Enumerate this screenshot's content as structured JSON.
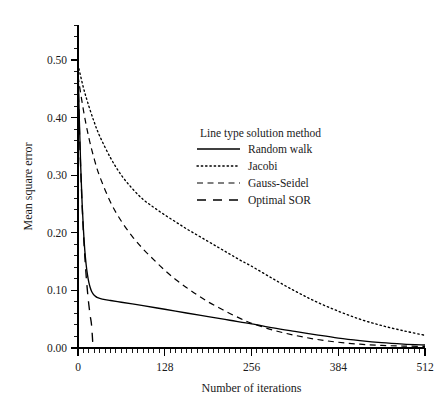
{
  "chart_data": {
    "type": "line",
    "title": "",
    "xlabel": "Number of iterations",
    "ylabel": "Mean square error",
    "xlim": [
      0,
      512
    ],
    "ylim": [
      0.0,
      0.56
    ],
    "xticks": [
      0,
      128,
      256,
      384,
      512
    ],
    "xtick_labels": [
      "0",
      "128",
      "256",
      "384",
      "512"
    ],
    "yticks": [
      0.0,
      0.1,
      0.2,
      0.3,
      0.4,
      0.5
    ],
    "ytick_labels": [
      "0.00",
      "0.10",
      "0.20",
      "0.30",
      "0.40",
      "0.50"
    ],
    "grid": false,
    "legend_position": "upper-center-right",
    "legend_title": "Line type solution method",
    "series": [
      {
        "name": "Random walk",
        "linestyle": "solid",
        "color": "#000000",
        "x": [
          0,
          2,
          4,
          6,
          8,
          10,
          12,
          14,
          16,
          18,
          20,
          22,
          24,
          26,
          28,
          32,
          40,
          48,
          64,
          80,
          96,
          128,
          160,
          192,
          224,
          256,
          288,
          320,
          352,
          384,
          416,
          448,
          480,
          512
        ],
        "y": [
          0.489,
          0.395,
          0.315,
          0.253,
          0.206,
          0.17,
          0.145,
          0.127,
          0.114,
          0.105,
          0.0985,
          0.0945,
          0.0915,
          0.0895,
          0.088,
          0.0862,
          0.084,
          0.0825,
          0.0795,
          0.0765,
          0.0735,
          0.0672,
          0.0608,
          0.0545,
          0.0482,
          0.042,
          0.035,
          0.0288,
          0.0228,
          0.0172,
          0.0128,
          0.0092,
          0.0068,
          0.0052
        ]
      },
      {
        "name": "Jacobi",
        "linestyle": "dotted",
        "color": "#000000",
        "x": [
          0,
          8,
          16,
          24,
          32,
          48,
          64,
          80,
          96,
          112,
          128,
          144,
          160,
          176,
          192,
          208,
          224,
          240,
          256,
          288,
          320,
          352,
          384,
          416,
          448,
          480,
          512
        ],
        "y": [
          0.492,
          0.452,
          0.42,
          0.392,
          0.368,
          0.33,
          0.3,
          0.277,
          0.258,
          0.244,
          0.231,
          0.219,
          0.207,
          0.196,
          0.185,
          0.174,
          0.163,
          0.152,
          0.142,
          0.12,
          0.099,
          0.08,
          0.064,
          0.05,
          0.039,
          0.03,
          0.022
        ]
      },
      {
        "name": "Gauss-Seidel",
        "linestyle": "dashed",
        "color": "#000000",
        "x": [
          0,
          8,
          16,
          24,
          32,
          48,
          64,
          80,
          96,
          112,
          128,
          144,
          160,
          176,
          192,
          208,
          224,
          240,
          256,
          288,
          320,
          352,
          384,
          416,
          448,
          480,
          512
        ],
        "y": [
          0.472,
          0.413,
          0.365,
          0.328,
          0.298,
          0.253,
          0.22,
          0.194,
          0.172,
          0.153,
          0.135,
          0.119,
          0.105,
          0.092,
          0.08,
          0.07,
          0.06,
          0.051,
          0.043,
          0.031,
          0.022,
          0.015,
          0.01,
          0.0066,
          0.0045,
          0.0034,
          0.0028
        ]
      },
      {
        "name": "Optimal SOR",
        "linestyle": "longdash",
        "color": "#000000",
        "x": [
          0,
          2,
          4,
          6,
          8,
          10,
          12,
          14,
          16,
          18,
          20,
          22
        ],
        "y": [
          0.47,
          0.383,
          0.31,
          0.25,
          0.2,
          0.16,
          0.126,
          0.098,
          0.075,
          0.056,
          0.04,
          0.005
        ]
      }
    ],
    "annotations": []
  },
  "legend": {
    "title": "Line type solution method",
    "entries": [
      {
        "label": "Random walk",
        "style": "solid"
      },
      {
        "label": "Jacobi",
        "style": "dotted"
      },
      {
        "label": "Gauss-Seidel",
        "style": "dashed"
      },
      {
        "label": "Optimal SOR",
        "style": "longdash"
      }
    ]
  },
  "axes": {
    "x_title": "Number of iterations",
    "y_title": "Mean square error",
    "x_tick_labels": [
      "0",
      "128",
      "256",
      "384",
      "512"
    ],
    "y_tick_labels": [
      "0.00",
      "0.10",
      "0.20",
      "0.30",
      "0.40",
      "0.50"
    ]
  },
  "colors": {
    "ink": "#000000",
    "background": "#ffffff"
  }
}
